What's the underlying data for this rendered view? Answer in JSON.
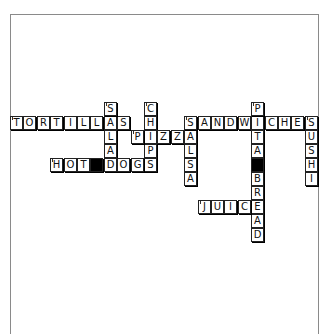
{
  "puzzle": {
    "type": "crossword",
    "theme": "food",
    "grid": {
      "origin_x": 10,
      "origin_y": 102,
      "cell_w": 13.4,
      "cell_h": 14
    },
    "words": [
      {
        "answer": "TORTILLAS",
        "direction": "across",
        "row": 1,
        "col": 0
      },
      {
        "answer": "SALAD",
        "direction": "down",
        "row": 0,
        "col": 7
      },
      {
        "answer": "CHIPS",
        "direction": "down",
        "row": 0,
        "col": 10
      },
      {
        "answer": "PIZZA",
        "direction": "across",
        "row": 2,
        "col": 9
      },
      {
        "answer": "HOT DOGS",
        "direction": "across",
        "row": 4,
        "col": 3
      },
      {
        "answer": "SANDWICHES",
        "direction": "across",
        "row": 1,
        "col": 13
      },
      {
        "answer": "SALSA",
        "direction": "down",
        "row": 1,
        "col": 13
      },
      {
        "answer": "PITA BREAD",
        "direction": "down",
        "row": 0,
        "col": 18
      },
      {
        "answer": "SUSHI",
        "direction": "down",
        "row": 1,
        "col": 22
      },
      {
        "answer": "JUICE",
        "direction": "across",
        "row": 7,
        "col": 14
      }
    ]
  }
}
